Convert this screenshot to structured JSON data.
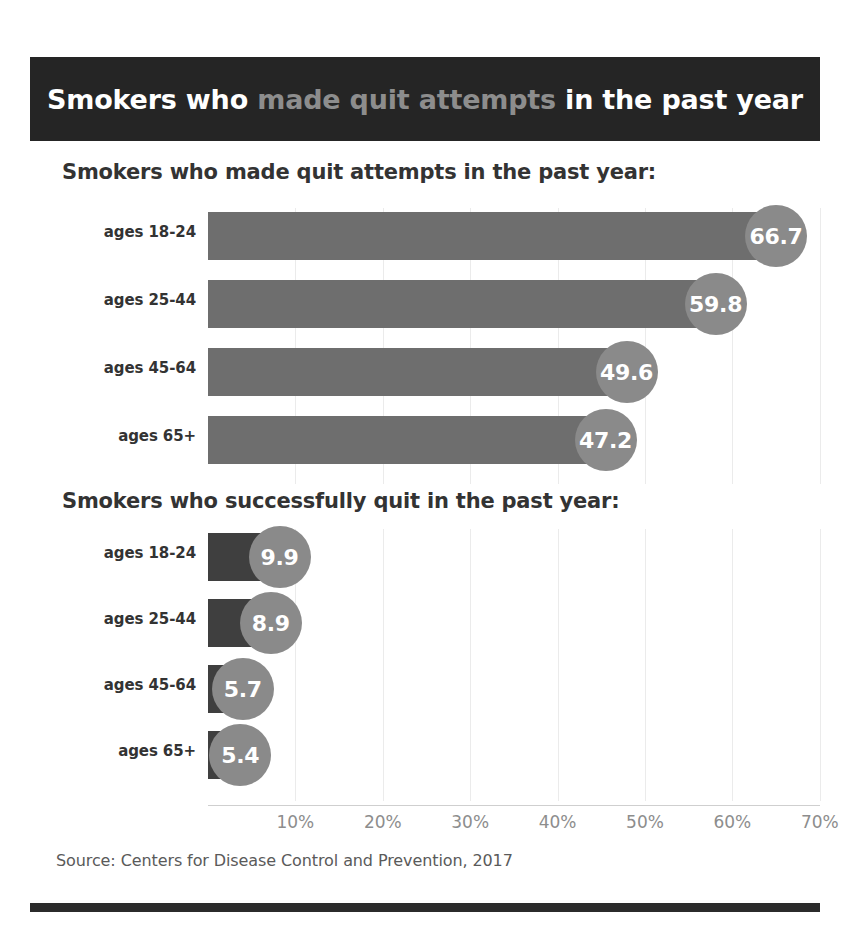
{
  "header": {
    "title_full": "Smokers who made quit attempts in the past year",
    "title_part_pre": "Smokers who ",
    "title_part_highlight": "made quit attempts",
    "title_part_post": " in the past year",
    "background_color": "#252525",
    "text_color": "#ffffff",
    "highlight_color": "#8d8d8d"
  },
  "sections": [
    {
      "title": "Smokers who made quit attempts in the past year:"
    },
    {
      "title": "Smokers who successfully quit in the past year:"
    }
  ],
  "axis": {
    "tick_labels": [
      "10%",
      "20%",
      "30%",
      "40%",
      "50%",
      "60%",
      "70%"
    ],
    "tick_values": [
      10,
      20,
      30,
      40,
      50,
      60,
      70
    ],
    "min": 0,
    "max": 70
  },
  "footer": {
    "source": "Source: Centers for Disease Control and Prevention, 2017"
  },
  "colors": {
    "bar_attempts": "#6e6e6e",
    "bar_quit": "#3f3f3f",
    "bubble": "#8a8a8a",
    "bubble_text": "#ffffff",
    "gridline": "#ebebeb",
    "axis_text": "#8d8d8d",
    "label_text": "#333333",
    "source_text": "#5a5a5a",
    "rule": "#2b2b2b"
  },
  "chart_data": [
    {
      "type": "bar",
      "orientation": "horizontal",
      "title": "Smokers who made quit attempts in the past year:",
      "xlabel": "",
      "ylabel": "",
      "categories": [
        "ages 18-24",
        "ages 25-44",
        "ages 45-64",
        "ages 65+"
      ],
      "values": [
        66.7,
        59.8,
        49.6,
        47.2
      ],
      "value_labels": [
        "66.7",
        "59.8",
        "49.6",
        "47.2"
      ],
      "xlim": [
        0,
        70
      ],
      "xticks": [
        10,
        20,
        30,
        40,
        50,
        60,
        70
      ],
      "xtick_labels": [
        "10%",
        "20%",
        "30%",
        "40%",
        "50%",
        "60%",
        "70%"
      ],
      "grid": true,
      "legend": "none",
      "units": "percent",
      "bar_color": "#6e6e6e"
    },
    {
      "type": "bar",
      "orientation": "horizontal",
      "title": "Smokers who successfully quit in the past year:",
      "xlabel": "",
      "ylabel": "",
      "categories": [
        "ages 18-24",
        "ages 25-44",
        "ages 45-64",
        "ages 65+"
      ],
      "values": [
        9.9,
        8.9,
        5.7,
        5.4
      ],
      "value_labels": [
        "9.9",
        "8.9",
        "5.7",
        "5.4"
      ],
      "xlim": [
        0,
        70
      ],
      "xticks": [
        10,
        20,
        30,
        40,
        50,
        60,
        70
      ],
      "xtick_labels": [
        "10%",
        "20%",
        "30%",
        "40%",
        "50%",
        "60%",
        "70%"
      ],
      "grid": true,
      "legend": "none",
      "units": "percent",
      "bar_color": "#3f3f3f"
    }
  ]
}
